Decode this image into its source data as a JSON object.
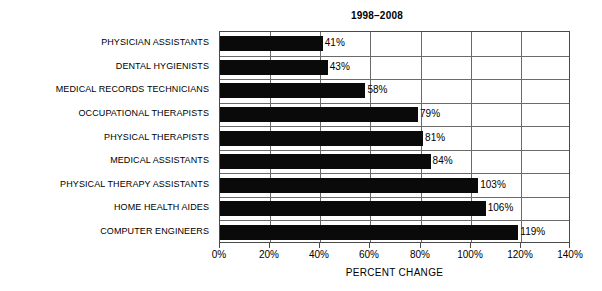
{
  "chart_data": {
    "type": "bar",
    "orientation": "horizontal",
    "title": "1998–2008",
    "xlabel": "PERCENT CHANGE",
    "ylabel": "",
    "xlim": [
      0,
      140
    ],
    "xtick_labels": [
      "0%",
      "20%",
      "40%",
      "60%",
      "80%",
      "100%",
      "120%",
      "140%"
    ],
    "xticks": [
      0,
      20,
      40,
      60,
      80,
      100,
      120,
      140
    ],
    "grid": true,
    "legend": null,
    "bar_color": "#0a0a0a",
    "categories": [
      "PHYSICIAN ASSISTANTS",
      "DENTAL HYGIENISTS",
      "MEDICAL RECORDS TECHNICIANS",
      "OCCUPATIONAL THERAPISTS",
      "PHYSICAL THERAPISTS",
      "MEDICAL ASSISTANTS",
      "PHYSICAL THERAPY ASSISTANTS",
      "HOME HEALTH AIDES",
      "COMPUTER ENGINEERS"
    ],
    "values": [
      41,
      43,
      58,
      79,
      81,
      84,
      103,
      106,
      119
    ],
    "value_labels": [
      "41%",
      "43%",
      "58%",
      "79%",
      "81%",
      "84%",
      "103%",
      "106%",
      "119%"
    ]
  }
}
